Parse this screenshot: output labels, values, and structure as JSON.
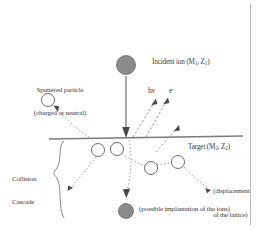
{
  "figure": {
    "background_color": "#ffffff",
    "text_color": "#3a3a3a",
    "line_color": "#6e6e6e",
    "filled_circle_color": "#8a8a8a",
    "open_circle_color": "#ffffff",
    "frame": {
      "right_border": true,
      "border_color": "#b9b9b9"
    }
  },
  "labels": {
    "incident_ion": {
      "text": "Incident ion (M",
      "sub1": "1",
      "mid": ", Z",
      "sub2": "1",
      "tail": ")"
    },
    "sputtered_particle_line1": "Sputtered particle",
    "sputtered_particle_line2": "(charged or neutral)",
    "photon": "hv",
    "electron": "e",
    "electron_sup": "-",
    "target": {
      "text": "Target (M",
      "sub1": "2",
      "mid": ", Z",
      "sub2": "2",
      "tail": ")"
    },
    "collision_cascade_line1": "Collision",
    "collision_cascade_line2": "Cascade",
    "displacement_line1": "(displacement",
    "displacement_line2": "of the lattice)",
    "implantation": "(possible implantation of the ions)"
  },
  "elements": {
    "incident_ion_circle": {
      "cx": 126,
      "cy": 65,
      "r": 9.5,
      "fill": "#8a8a8a"
    },
    "implanted_ion_circle": {
      "cx": 126,
      "cy": 211,
      "r": 7.5,
      "fill": "#8a8a8a"
    },
    "sputtered_particle_circle": {
      "cx": 48,
      "cy": 100,
      "r": 6.5
    },
    "lattice_atoms": [
      {
        "cx": 98,
        "cy": 150,
        "r": 6.5
      },
      {
        "cx": 117,
        "cy": 149,
        "r": 6.5
      },
      {
        "cx": 151,
        "cy": 168,
        "r": 6.5
      },
      {
        "cx": 178,
        "cy": 162,
        "r": 6.5
      }
    ],
    "surface_line": {
      "x1": 49,
      "y1": 139,
      "x2": 243,
      "y2": 136
    },
    "incident_arrow": {
      "x1": 126,
      "y1": 76,
      "x2": 126,
      "y2": 136
    },
    "emission_arrows": [
      {
        "x1": 133,
        "y1": 136,
        "x2": 155,
        "y2": 99
      },
      {
        "x1": 137,
        "y1": 136,
        "x2": 167,
        "y2": 98
      },
      {
        "x1": 155,
        "y1": 151,
        "x2": 178,
        "y2": 126
      }
    ],
    "cascade_brace": {
      "x": 60,
      "y_top": 141,
      "y_bottom": 218
    }
  }
}
